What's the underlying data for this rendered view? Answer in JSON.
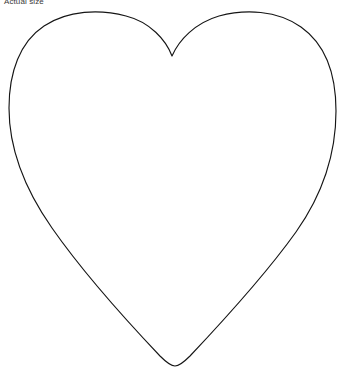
{
  "canvas": {
    "width": 343,
    "height": 375,
    "background_color": "#ffffff"
  },
  "caption": {
    "text": "Actual size",
    "color": "#3a3a3a",
    "font_size_px": 8,
    "position": {
      "x": 4,
      "y": -3
    },
    "clipped_at_top_edge": true
  },
  "shape": {
    "name": "heart-outline",
    "stroke_color": "#151515",
    "stroke_width_px": 1.15,
    "fill": "none",
    "key_points": {
      "left_lobe_peak": {
        "x": 85,
        "y": 15
      },
      "right_lobe_peak": {
        "x": 265,
        "y": 14
      },
      "center_notch_bottom": {
        "x": 172,
        "y": 56
      },
      "leftmost": {
        "x": 9,
        "y": 115
      },
      "rightmost": {
        "x": 336,
        "y": 112
      },
      "bottom_tip": {
        "x": 175,
        "y": 366
      }
    },
    "path": "M 172 56 C 166 40 150 22 126 16 C 100 9 68 10 44 26 C 20 42 9 72 9 108 C 9 148 24 188 52 228 C 82 271 124 318 160 356 C 166 362 171 366 175 366 C 179 366 184 362 190 356 C 224 320 266 274 296 232 C 325 191 336 152 336 111 C 336 74 325 44 301 27 C 277 10 245 9 219 16 C 195 23 179 40 172 56 Z"
  }
}
